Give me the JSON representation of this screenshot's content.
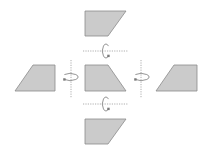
{
  "diagram": {
    "title": "",
    "colors": {
      "shape_fill": "#cbcbcb",
      "shape_stroke": "#8a8a8a",
      "axis": "#9a9a9a",
      "arrow": "#7a7a7a",
      "background": "#ffffff"
    },
    "shapes": [
      {
        "id": "center",
        "label": "",
        "points": "85,65 108,65 126,91 85,91"
      },
      {
        "id": "top",
        "label": "",
        "points": "85,11 126,11 108,36 85,36"
      },
      {
        "id": "bottom",
        "label": "",
        "points": "85,119 126,119 108,144 85,144"
      },
      {
        "id": "left",
        "label": "",
        "points": "33,65 55,65 55,91 15,91"
      },
      {
        "id": "right",
        "label": "",
        "points": "174,65 197,65 197,91 156,91"
      }
    ],
    "axes": [
      {
        "id": "top-axis",
        "orientation": "horizontal",
        "x1": 83,
        "y1": 51,
        "x2": 128,
        "y2": 51
      },
      {
        "id": "bottom-axis",
        "orientation": "horizontal",
        "x1": 83,
        "y1": 104,
        "x2": 128,
        "y2": 104
      },
      {
        "id": "left-axis",
        "orientation": "vertical",
        "x1": 71,
        "y1": 60,
        "x2": 71,
        "y2": 98
      },
      {
        "id": "right-axis",
        "orientation": "vertical",
        "x1": 141,
        "y1": 60,
        "x2": 141,
        "y2": 98
      }
    ],
    "rotation_arrows": [
      {
        "id": "top-rotation",
        "cx": 106,
        "cy": 51,
        "rx": 3.5,
        "ry": 7,
        "vertical": true
      },
      {
        "id": "bottom-rotation",
        "cx": 106,
        "cy": 104,
        "rx": 3.5,
        "ry": 7,
        "vertical": true
      },
      {
        "id": "left-rotation",
        "cx": 70,
        "cy": 77,
        "rx": 8,
        "ry": 3.5,
        "vertical": false
      },
      {
        "id": "right-rotation",
        "cx": 141,
        "cy": 77,
        "rx": 8,
        "ry": 3.5,
        "vertical": false
      }
    ]
  }
}
